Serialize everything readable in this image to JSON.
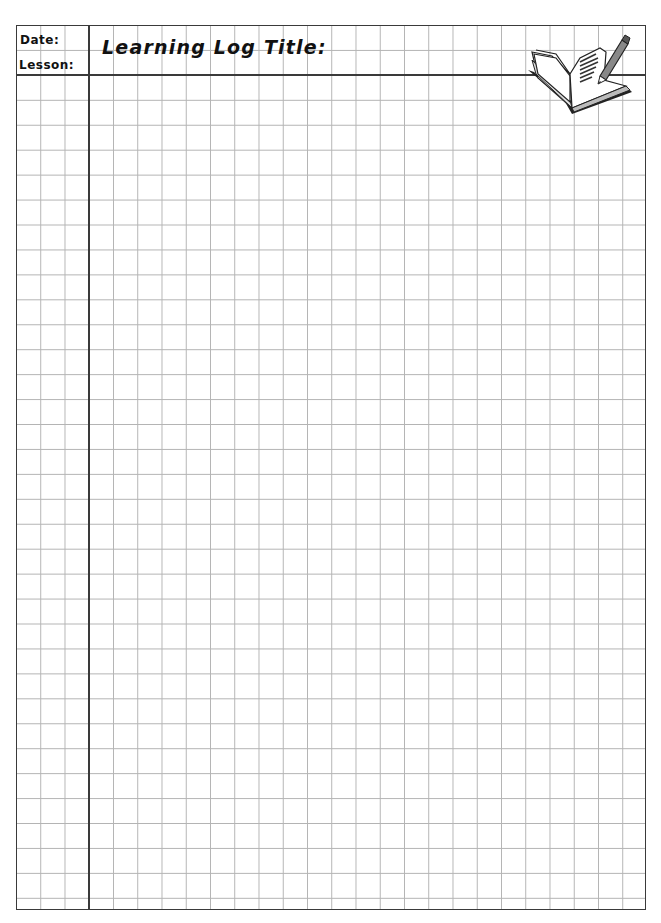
{
  "header": {
    "date_label": "Date:",
    "lesson_label": "Lesson:",
    "title_label": "Learning Log Title:"
  },
  "grid": {
    "columns": 26,
    "rows": 36,
    "line_color": "#b4b4b4",
    "border_color": "#3a3a3a"
  },
  "icons": {
    "decoration": "open-book-with-pencil-icon"
  }
}
